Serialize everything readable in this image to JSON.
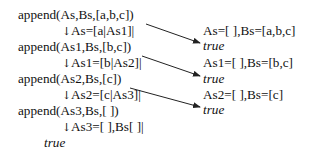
{
  "left_column": [
    {
      "kind": "goal",
      "text": "append(As,Bs,[a,b,c])"
    },
    {
      "kind": "binding",
      "arrow": "↓",
      "text": "As=[a|As1]|"
    },
    {
      "kind": "goal",
      "text": "append(As1,Bs,[b,c])"
    },
    {
      "kind": "binding",
      "arrow": "↓",
      "text": "As1=[b|As2]|"
    },
    {
      "kind": "goal",
      "text": "append(As2,Bs,[c])"
    },
    {
      "kind": "binding",
      "arrow": "↓",
      "text": "As2=[c|As3]|"
    },
    {
      "kind": "goal",
      "text": "append(As3,Bs,[ ])"
    },
    {
      "kind": "binding",
      "arrow": "↓",
      "text": "As3=[ ],Bs[ ]|"
    },
    {
      "kind": "result",
      "text": "true"
    }
  ],
  "right_column": [
    {
      "binding": "As=[ ],Bs=[a,b,c]",
      "result": "true"
    },
    {
      "binding": "As1=[ ],Bs=[b,c]",
      "result": "true"
    },
    {
      "binding": "As2=[ ],Bs=[c]",
      "result": "true"
    }
  ],
  "colors": {
    "text": "#111111",
    "background": "#ffffff",
    "arrow": "#222222"
  }
}
